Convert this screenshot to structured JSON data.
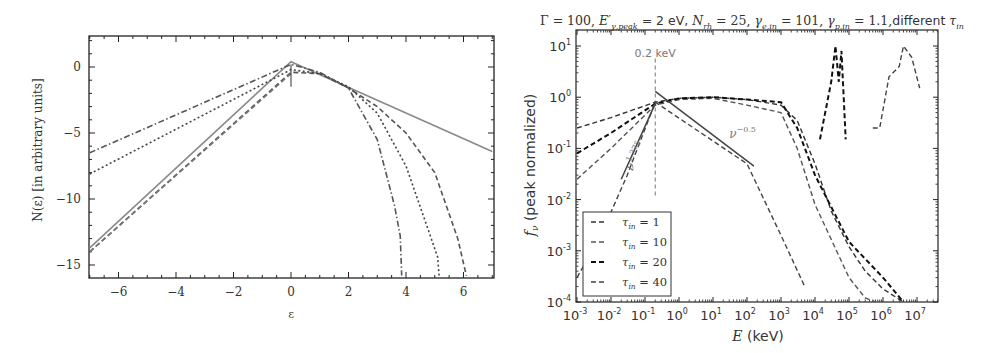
{
  "chart_data": [
    {
      "type": "line",
      "title": "",
      "xlabel": "ε",
      "ylabel": "N(ε)  [in arbitrary units]",
      "xlim": [
        -7,
        7
      ],
      "ylim": [
        -16,
        2.3
      ],
      "xticks": [
        -6,
        -4,
        -2,
        0,
        2,
        4,
        6
      ],
      "xtick_labels": [
        "−6",
        "−4",
        "−2",
        "0",
        "2",
        "4",
        "6"
      ],
      "yticks": [
        0,
        -5,
        -10,
        -15
      ],
      "ytick_labels": [
        "0",
        "−5",
        "−10",
        "−15"
      ],
      "grid": false,
      "legend": null,
      "series": [
        {
          "name": "solid (gray)",
          "style": "solid",
          "color": "#8a8a8a",
          "x": [
            -7,
            0,
            7
          ],
          "y": [
            -13.7,
            0.4,
            -6.4
          ]
        },
        {
          "name": "dashed",
          "style": "dashed",
          "color": "#555555",
          "x": [
            -7,
            0,
            1,
            2,
            3,
            4,
            5,
            5.8,
            6.1
          ],
          "y": [
            -14,
            -0.4,
            -0.5,
            -1.6,
            -3.0,
            -5.0,
            -8.0,
            -13.0,
            -15.8
          ]
        },
        {
          "name": "dotted",
          "style": "dotted",
          "color": "#444444",
          "x": [
            -7,
            0,
            1,
            2,
            3,
            4,
            4.8,
            5.1,
            5.15
          ],
          "y": [
            -8.1,
            -0.2,
            -0.5,
            -1.5,
            -3.5,
            -7.5,
            -12.5,
            -14.4,
            -15.8
          ]
        },
        {
          "name": "dash-dot",
          "style": "dashdot",
          "color": "#555555",
          "x": [
            -7,
            0,
            1,
            2,
            3,
            3.6,
            3.8,
            3.85
          ],
          "y": [
            -6.5,
            0.2,
            -0.4,
            -1.6,
            -5.5,
            -10.5,
            -12.8,
            -15.8
          ]
        },
        {
          "name": "dashed (lower-left)",
          "style": "dashed",
          "color": "#777777",
          "x": [
            -7,
            0
          ],
          "y": [
            -14,
            -0.5
          ]
        }
      ],
      "annotations": [
        {
          "text": "↑",
          "x": 0,
          "y": -0.6
        }
      ]
    },
    {
      "type": "line",
      "title": "Γ = 100, E′γ,peak = 2 eV, N_rh = 25, γe,in = 101, γp,in = 1.1, different τin",
      "xlabel": "E (keV)",
      "ylabel": "fν (peak normalized)",
      "xscale": "log",
      "yscale": "log",
      "xlim": [
        0.001,
        30000000
      ],
      "ylim": [
        0.0001,
        20
      ],
      "xticks": [
        0.001,
        0.01,
        0.1,
        1,
        10,
        100,
        1000,
        10000,
        100000,
        1000000,
        10000000
      ],
      "xtick_labels": [
        "10^-3",
        "10^-2",
        "10^-1",
        "10^0",
        "10^1",
        "10^2",
        "10^3",
        "10^4",
        "10^5",
        "10^6",
        "10^7"
      ],
      "yticks": [
        0.0001,
        0.001,
        0.01,
        0.1,
        1,
        10
      ],
      "ytick_labels": [
        "10^-4",
        "10^-3",
        "10^-2",
        "10^-1",
        "10^0",
        "10^1"
      ],
      "grid": false,
      "legend": {
        "position": "lower left",
        "entries": [
          "τin = 1",
          "τin = 10",
          "τin = 20",
          "τin = 40"
        ]
      },
      "series": [
        {
          "name": "τin = 1",
          "style": "dashed",
          "color": "#333333",
          "x": [
            0.001,
            0.01,
            0.2,
            1,
            10,
            100,
            1000,
            3000,
            10000,
            30000,
            100000,
            300000,
            1000000,
            4000000
          ],
          "y": [
            0.25,
            0.4,
            0.8,
            0.95,
            1.0,
            0.9,
            0.7,
            0.35,
            0.05,
            0.006,
            0.0012,
            0.0004,
            0.00018,
            0.0001
          ]
        },
        {
          "name": "τin = 10",
          "style": "dashed",
          "color": "#555555",
          "x": [
            0.001,
            0.01,
            0.2,
            1,
            10,
            100,
            1000,
            3000,
            10000,
            100000,
            300000,
            600000
          ],
          "y": [
            0.025,
            0.1,
            0.7,
            0.9,
            0.95,
            0.7,
            0.5,
            0.1,
            0.008,
            0.0003,
            0.00012,
            0.0001
          ]
        },
        {
          "name": "τin = 20",
          "style": "dashed",
          "color": "#111111",
          "x": [
            0.001,
            0.01,
            0.2,
            1,
            10,
            100,
            1000,
            3000,
            10000,
            100000,
            1000000,
            4000000,
            14000,
            30000,
            40000,
            50000,
            60000,
            80000
          ],
          "y": [
            0.08,
            0.2,
            0.75,
            0.95,
            1.0,
            0.9,
            0.8,
            0.25,
            0.03,
            0.0015,
            0.0003,
            0.0001,
            0.15,
            2,
            10,
            2,
            8,
            0.15
          ]
        },
        {
          "name": "τin = 40",
          "style": "dashed",
          "color": "#444444",
          "x": [
            0.001,
            0.005,
            0.03,
            0.2,
            100,
            1000,
            5000,
            500000,
            800000,
            1500000,
            3000000,
            4000000,
            7000000,
            12000000
          ],
          "y": [
            0.0003,
            0.002,
            0.03,
            0.8,
            0.05,
            0.002,
            0.0002,
            0.25,
            0.25,
            2.5,
            4,
            10,
            6,
            1.5
          ]
        }
      ],
      "reference_lines": [
        {
          "label": "ν^1.375",
          "style": "solid",
          "x": [
            0.02,
            0.2
          ],
          "y": [
            0.025,
            0.75
          ]
        },
        {
          "label": "ν^-0.5",
          "style": "solid",
          "x": [
            0.2,
            160
          ],
          "y": [
            1.3,
            0.045
          ]
        },
        {
          "label": "0.2 keV",
          "style": "vertical-dashed",
          "x": 0.2,
          "y_range": [
            0.012,
            6
          ]
        }
      ],
      "annotations": [
        {
          "text": "0.2 keV",
          "x": 0.2,
          "y": 6
        },
        {
          "text": "ν^-0.5",
          "x": 30,
          "y": 0.16
        },
        {
          "text": "ν^1.375",
          "x": 0.04,
          "y": 0.04
        }
      ]
    }
  ],
  "left": {
    "xlabel": "ε",
    "ylabel": "N(ε)  [in arbitrary units]",
    "xtick_labels": [
      "−6",
      "−4",
      "−2",
      "0",
      "2",
      "4",
      "6"
    ],
    "ytick_labels": [
      "0",
      "−5",
      "−10",
      "−15"
    ]
  },
  "right": {
    "title_parts": {
      "gamma": "Γ = 100, ",
      "epeak_sym": "E′",
      "epeak_sub": "γ,peak",
      "epeak_val": " = 2 eV, ",
      "nrh_sym": "N",
      "nrh_sub": "rh",
      "nrh_val": " = 25, ",
      "ge_sym": "γ",
      "ge_sub": "e,in",
      "ge_val": " = 101, ",
      "gp_sym": "γ",
      "gp_sub": "p,in",
      "gp_val": " = 1.1,",
      "diff": "different ",
      "tau_sym": "τ",
      "tau_sub": "in"
    },
    "xlabel_sym": "E",
    "xlabel_unit": " (keV)",
    "ylabel_sym": "f",
    "ylabel_sub": "ν",
    "ylabel_text": " (peak normalized)",
    "xtick_exps": [
      "-3",
      "-2",
      "-1",
      "0",
      "1",
      "2",
      "3",
      "4",
      "5",
      "6",
      "7"
    ],
    "ytick_exps": [
      "1",
      "0",
      "-1",
      "-2",
      "-3",
      "-4"
    ],
    "tick_base": "10",
    "annot_02kev": "0.2 keV",
    "annot_nu_neg": "ν",
    "annot_nu_neg_exp": "−0.5",
    "annot_nu_pos": "ν",
    "annot_nu_pos_exp": "1.375",
    "legend": [
      {
        "sym": "τ",
        "sub": "in",
        "val": " = 1"
      },
      {
        "sym": "τ",
        "sub": "in",
        "val": " = 10"
      },
      {
        "sym": "τ",
        "sub": "in",
        "val": " = 20"
      },
      {
        "sym": "τ",
        "sub": "in",
        "val": " = 40"
      }
    ]
  }
}
